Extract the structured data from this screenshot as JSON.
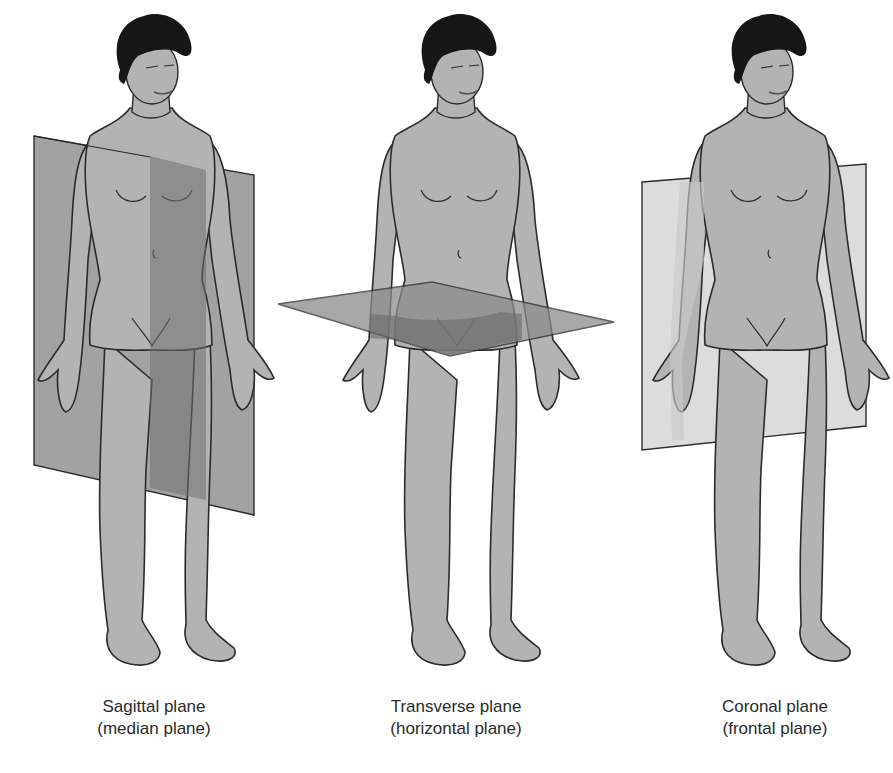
{
  "figure": {
    "colors": {
      "background": "#ffffff",
      "skin": "#b3b3b3",
      "outline": "#2b2b2b",
      "hair": "#161616",
      "plane_fill": "#8c8c8c",
      "plane_dark_overlap": "#7a7a7a",
      "coronal_plane_fill": "#dcdcdc"
    },
    "panels": [
      {
        "id": "sagittal",
        "caption_line1": "Sagittal plane",
        "caption_line2": "(median plane)"
      },
      {
        "id": "transverse",
        "caption_line1": "Transverse plane",
        "caption_line2": "(horizontal plane)"
      },
      {
        "id": "coronal",
        "caption_line1": "Coronal plane",
        "caption_line2": "(frontal plane)"
      }
    ]
  }
}
